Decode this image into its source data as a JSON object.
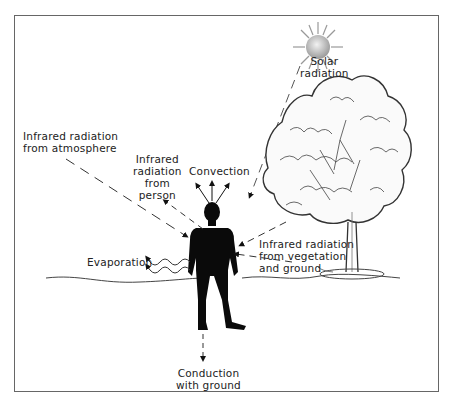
{
  "diagram": {
    "labels": {
      "solar": [
        "Solar",
        "radiation"
      ],
      "atmosphere": [
        "Infrared radiation",
        "from atmosphere"
      ],
      "person": [
        "Infrared",
        "radiation",
        "from",
        "person"
      ],
      "convection": "Convection",
      "evaporation": "Evaporation",
      "vegetation": [
        "Infrared radiation",
        "from vegetation",
        "and ground"
      ],
      "conduction": [
        "Conduction",
        "with ground"
      ]
    },
    "elements": [
      "sun",
      "tree",
      "person-silhouette",
      "ground-line",
      "frame"
    ],
    "colors": {
      "ink": "#111111",
      "frame": "#666666",
      "sun": "#bdbdbd",
      "background": "#ffffff"
    }
  }
}
